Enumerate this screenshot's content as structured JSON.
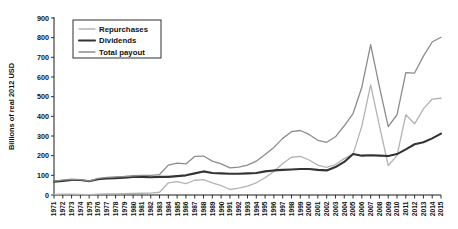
{
  "chart_data": {
    "type": "line",
    "title": "",
    "xlabel": "",
    "ylabel": "Billions of real 2012 USD",
    "ylim": [
      0,
      900
    ],
    "ytick_step": 100,
    "yticks": [
      0,
      100,
      200,
      300,
      400,
      500,
      600,
      700,
      800,
      900
    ],
    "grid": false,
    "legend_position": "top-left",
    "x": [
      1971,
      1972,
      1973,
      1974,
      1975,
      1976,
      1977,
      1978,
      1979,
      1980,
      1981,
      1982,
      1983,
      1984,
      1985,
      1986,
      1987,
      1988,
      1989,
      1990,
      1991,
      1992,
      1993,
      1994,
      1995,
      1996,
      1997,
      1998,
      1999,
      2000,
      2001,
      2002,
      2003,
      2004,
      2005,
      2006,
      2007,
      2008,
      2009,
      2010,
      2011,
      2012,
      2013,
      2014,
      2015
    ],
    "categories": [
      "1971",
      "1972",
      "1973",
      "1974",
      "1975",
      "1976",
      "1977",
      "1978",
      "1979",
      "1980",
      "1981",
      "1982",
      "1983",
      "1984",
      "1985",
      "1986",
      "1987",
      "1988",
      "1989",
      "1990",
      "1991",
      "1992",
      "1993",
      "1994",
      "1995",
      "1996",
      "1997",
      "1998",
      "1999",
      "2000",
      "2001",
      "2002",
      "2003",
      "2004",
      "2005",
      "2006",
      "2007",
      "2008",
      "2009",
      "2010",
      "2011",
      "2012",
      "2013",
      "2014",
      "2015"
    ],
    "series": [
      {
        "name": "Repurchases",
        "color": "#b3b3b3",
        "width": 1.3,
        "values": [
          3,
          4,
          4,
          3,
          2,
          4,
          6,
          6,
          7,
          8,
          9,
          10,
          14,
          62,
          68,
          58,
          75,
          78,
          62,
          48,
          28,
          35,
          45,
          62,
          88,
          120,
          160,
          192,
          196,
          178,
          152,
          140,
          155,
          185,
          208,
          350,
          560,
          352,
          150,
          200,
          408,
          362,
          438,
          488,
          492
        ]
      },
      {
        "name": "Dividends",
        "color": "#333333",
        "width": 2.1,
        "values": [
          68,
          72,
          76,
          76,
          70,
          80,
          84,
          86,
          88,
          92,
          92,
          90,
          92,
          92,
          96,
          100,
          110,
          120,
          112,
          110,
          108,
          108,
          110,
          112,
          120,
          125,
          128,
          130,
          132,
          132,
          128,
          125,
          142,
          168,
          208,
          200,
          202,
          200,
          198,
          208,
          232,
          258,
          268,
          288,
          312
        ]
      },
      {
        "name": "Total payout",
        "color": "#8c8c8c",
        "width": 1.3,
        "values": [
          70,
          76,
          80,
          78,
          70,
          84,
          90,
          92,
          94,
          98,
          100,
          100,
          104,
          152,
          162,
          158,
          196,
          198,
          172,
          158,
          138,
          142,
          152,
          172,
          206,
          242,
          288,
          322,
          328,
          308,
          278,
          268,
          296,
          352,
          414,
          548,
          765,
          550,
          348,
          408,
          622,
          620,
          706,
          778,
          802
        ]
      }
    ],
    "legend": [
      {
        "label": "Repurchases",
        "color": "#b3b3b3"
      },
      {
        "label": "Dividends",
        "color": "#333333"
      },
      {
        "label": "Total payout",
        "color": "#8c8c8c"
      }
    ]
  }
}
